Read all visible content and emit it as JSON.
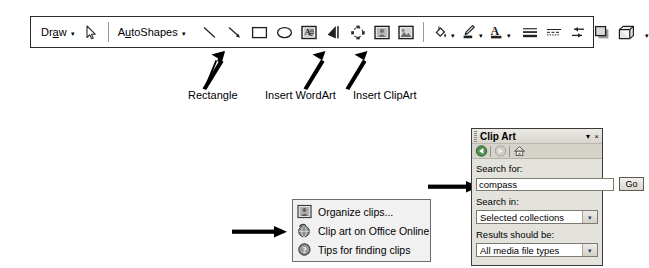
{
  "toolbar": {
    "name": "Drawing toolbar",
    "draw_menu": {
      "label": "Draw",
      "accel": "a",
      "caret": "▾"
    },
    "autoshapes_menu": {
      "label": "AutoShapes",
      "accel": "u",
      "caret": "▾"
    },
    "buttons": [
      {
        "name": "select-objects-icon",
        "tip": "Select Objects"
      },
      {
        "name": "line-icon",
        "tip": "Line"
      },
      {
        "name": "arrow-icon",
        "tip": "Arrow"
      },
      {
        "name": "rectangle-icon",
        "tip": "Rectangle"
      },
      {
        "name": "oval-icon",
        "tip": "Oval"
      },
      {
        "name": "text-box-icon",
        "tip": "Text Box"
      },
      {
        "name": "insert-wordart-icon",
        "tip": "Insert WordArt"
      },
      {
        "name": "insert-diagram-icon",
        "tip": "Insert Diagram or Organization Chart"
      },
      {
        "name": "insert-clipart-icon",
        "tip": "Insert Clip Art"
      },
      {
        "name": "insert-picture-icon",
        "tip": "Insert Picture"
      },
      {
        "name": "fill-color-icon",
        "tip": "Fill Color"
      },
      {
        "name": "line-color-icon",
        "tip": "Line Color"
      },
      {
        "name": "font-color-icon",
        "tip": "Font Color"
      },
      {
        "name": "line-style-icon",
        "tip": "Line Style"
      },
      {
        "name": "dash-style-icon",
        "tip": "Dash Style"
      },
      {
        "name": "arrow-style-icon",
        "tip": "Arrow Style"
      },
      {
        "name": "shadow-style-icon",
        "tip": "Shadow Style"
      },
      {
        "name": "three-d-style-icon",
        "tip": "3-D Style"
      }
    ],
    "overflow_caret": "▾"
  },
  "callouts": [
    {
      "label": "Rectangle"
    },
    {
      "label": "Insert WordArt"
    },
    {
      "label": "Insert ClipArt"
    }
  ],
  "context_menu": {
    "items": [
      {
        "label": "Organize clips...",
        "icon": "organize-clips-icon"
      },
      {
        "label": "Clip art on Office Online",
        "icon": "office-online-icon"
      },
      {
        "label": "Tips for finding clips",
        "icon": "tips-help-icon"
      }
    ]
  },
  "clipart_pane": {
    "title": "Clip Art",
    "title_caret": "▾",
    "close_label": "×",
    "nav": [
      {
        "name": "back-icon",
        "tip": "Back"
      },
      {
        "name": "forward-icon",
        "tip": "Forward"
      },
      {
        "name": "home-icon",
        "tip": "Home"
      }
    ],
    "search_for_label": "Search for:",
    "search_value": "compass",
    "search_placeholder": "Search for:",
    "go_label": "Go",
    "search_in_label": "Search in:",
    "search_in_value": "Selected collections",
    "results_label": "Results should be:",
    "results_value": "All media file types",
    "combo_arrow": "▾"
  },
  "colors": {
    "toolbar_border": "#2b2b2b",
    "pane_bg": "#e4e2dd",
    "menu_bg": "#f1f1f1",
    "arrow": "#000000"
  }
}
